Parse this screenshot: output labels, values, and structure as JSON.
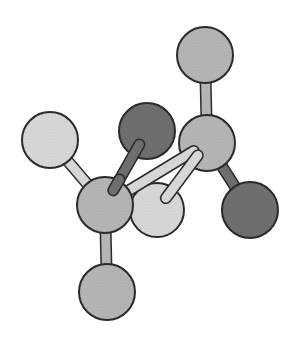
{
  "diagram": {
    "type": "ball-and-stick molecular model",
    "colors": {
      "background": "#ffffff",
      "outline": "#2a2a2a",
      "mid_gray": "#b4b4b4",
      "light_gray": "#d6d6d6",
      "dark_gray": "#6e6e6e"
    },
    "atoms": [
      {
        "id": "top",
        "shade": "mid_gray",
        "cx": 205,
        "cy": 55,
        "r": 28
      },
      {
        "id": "right-center",
        "shade": "mid_gray",
        "cx": 207,
        "cy": 143,
        "r": 28
      },
      {
        "id": "upper-left",
        "shade": "light_gray",
        "cx": 50,
        "cy": 140,
        "r": 28
      },
      {
        "id": "upper-dark",
        "shade": "dark_gray",
        "cx": 147,
        "cy": 131,
        "r": 28
      },
      {
        "id": "left-center",
        "shade": "mid_gray",
        "cx": 105,
        "cy": 205,
        "r": 28
      },
      {
        "id": "lower-light",
        "shade": "light_gray",
        "cx": 157,
        "cy": 210,
        "r": 27
      },
      {
        "id": "right-dark",
        "shade": "dark_gray",
        "cx": 250,
        "cy": 210,
        "r": 28
      },
      {
        "id": "bottom",
        "shade": "mid_gray",
        "cx": 107,
        "cy": 292,
        "r": 28
      }
    ],
    "bonds": [
      {
        "from": "top",
        "to": "right-center",
        "shade": "mid_gray"
      },
      {
        "from": "upper-left",
        "to": "left-center",
        "shade": "light_gray"
      },
      {
        "from": "upper-dark",
        "to": "left-center",
        "shade": "dark_gray"
      },
      {
        "from": "left-center",
        "to": "bottom",
        "shade": "mid_gray"
      },
      {
        "from": "left-center",
        "to": "right-center",
        "shade": "light_gray"
      },
      {
        "from": "right-center",
        "to": "lower-light",
        "shade": "light_gray"
      },
      {
        "from": "right-center",
        "to": "right-dark",
        "shade": "dark_gray"
      }
    ]
  }
}
